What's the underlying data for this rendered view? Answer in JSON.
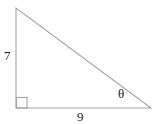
{
  "figure": {
    "type": "right-triangle",
    "labels": {
      "vertical_side": "7",
      "horizontal_side": "9",
      "angle": "θ"
    },
    "colors": {
      "line": "#a3a3a3",
      "text": "#1c1c1c",
      "background": "#ffffff"
    }
  }
}
